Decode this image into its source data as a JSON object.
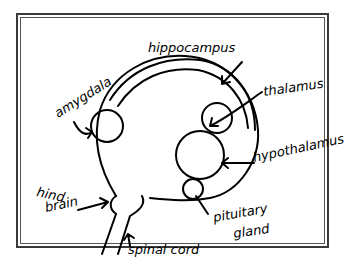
{
  "diagram": {
    "title": "",
    "style": "hand-drawn sketch",
    "labels": {
      "hippocampus": "hippocampus",
      "amygdala": "amygdala",
      "thalamus": "thalamus",
      "hypothalamus": "hypothalamus",
      "pituitary": "pituitary",
      "gland": "gland",
      "hind": "hind",
      "brain": "brain",
      "spinal_cord": "spinal cord"
    },
    "structures": [
      {
        "name": "hippocampus",
        "shape": "arc"
      },
      {
        "name": "amygdala",
        "shape": "circle"
      },
      {
        "name": "thalamus",
        "shape": "circle"
      },
      {
        "name": "hypothalamus",
        "shape": "circle"
      },
      {
        "name": "pituitary gland",
        "shape": "circle"
      },
      {
        "name": "hind brain",
        "shape": "bulge"
      },
      {
        "name": "spinal cord",
        "shape": "stem"
      }
    ],
    "colors": {
      "ink": "#000000",
      "background": "#ffffff",
      "frame": "#3a3a3a"
    }
  }
}
